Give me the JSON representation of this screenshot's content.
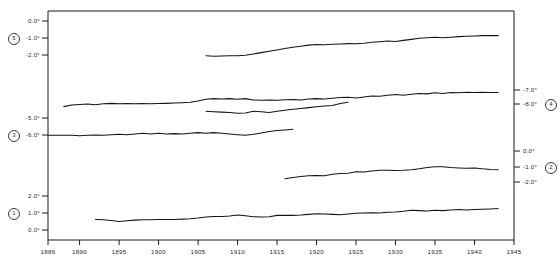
{
  "chart_data": {
    "type": "line",
    "title": "",
    "subtitle": "",
    "xlabel": "",
    "ylabel": "",
    "grid": false,
    "legend_position": "inline-axis-markers",
    "xlim": [
      1886,
      1945
    ],
    "x_ticks": [
      {
        "value": 1886,
        "label": "1886"
      },
      {
        "value": 1890,
        "label": "1890"
      },
      {
        "value": 1895,
        "label": "1895"
      },
      {
        "value": 1900,
        "label": "1900"
      },
      {
        "value": 1905,
        "label": "1905"
      },
      {
        "value": 1910,
        "label": "1910"
      },
      {
        "value": 1915,
        "label": "1915"
      },
      {
        "value": 1920,
        "label": "1920"
      },
      {
        "value": 1925,
        "label": "1925"
      },
      {
        "value": 1930,
        "label": "1930"
      },
      {
        "value": 1935,
        "label": "1935"
      },
      {
        "value": 1940,
        "label": "1940"
      },
      {
        "value": 1945,
        "label": "1945"
      }
    ],
    "left_axis_ticks": [
      {
        "label": "0.0°",
        "y": 21
      },
      {
        "label": "-1.0°",
        "y": 38,
        "series_marker": "5"
      },
      {
        "label": "-2.0°",
        "y": 55
      },
      {
        "label": "-5.0°",
        "y": 118
      },
      {
        "label": "-6.0°",
        "y": 135,
        "series_marker": "3"
      },
      {
        "label": "2.0°",
        "y": 196
      },
      {
        "label": "1.0°",
        "y": 213,
        "series_marker": "1"
      },
      {
        "label": "0.0°",
        "y": 230
      }
    ],
    "right_axis_ticks": [
      {
        "label": "-7.0°",
        "y": 90
      },
      {
        "label": "-8.0°",
        "y": 104,
        "series_marker": "4"
      },
      {
        "label": "0.0°",
        "y": 151
      },
      {
        "label": "-1.0°",
        "y": 167,
        "series_marker": "2"
      },
      {
        "label": "-2.0°",
        "y": 182
      }
    ],
    "series": [
      {
        "name": "5",
        "marker": "5",
        "axis": "left",
        "x_start": 1906,
        "x_end": 1943,
        "points": [
          [
            1906,
            -2.05
          ],
          [
            1907,
            -2.07
          ],
          [
            1908,
            -2.06
          ],
          [
            1909,
            -2.04
          ],
          [
            1910,
            -2.05
          ],
          [
            1911,
            -2.02
          ],
          [
            1912,
            -1.94
          ],
          [
            1913,
            -1.86
          ],
          [
            1914,
            -1.78
          ],
          [
            1915,
            -1.7
          ],
          [
            1916,
            -1.62
          ],
          [
            1917,
            -1.55
          ],
          [
            1918,
            -1.48
          ],
          [
            1919,
            -1.42
          ],
          [
            1920,
            -1.38
          ],
          [
            1921,
            -1.4
          ],
          [
            1922,
            -1.37
          ],
          [
            1923,
            -1.35
          ],
          [
            1924,
            -1.33
          ],
          [
            1925,
            -1.34
          ],
          [
            1926,
            -1.31
          ],
          [
            1927,
            -1.25
          ],
          [
            1928,
            -1.22
          ],
          [
            1929,
            -1.18
          ],
          [
            1930,
            -1.2
          ],
          [
            1931,
            -1.14
          ],
          [
            1932,
            -1.08
          ],
          [
            1933,
            -1.02
          ],
          [
            1934,
            -0.98
          ],
          [
            1935,
            -0.95
          ],
          [
            1936,
            -0.99
          ],
          [
            1937,
            -0.95
          ],
          [
            1938,
            -0.92
          ],
          [
            1939,
            -0.9
          ],
          [
            1940,
            -0.88
          ],
          [
            1941,
            -0.86
          ],
          [
            1942,
            -0.86
          ],
          [
            1943,
            -0.86
          ]
        ]
      },
      {
        "name": "4",
        "marker": "4",
        "axis": "right",
        "x_start": 1906,
        "x_end": 1924,
        "points": [
          [
            1906,
            -8.52
          ],
          [
            1907,
            -8.55
          ],
          [
            1908,
            -8.58
          ],
          [
            1909,
            -8.6
          ],
          [
            1910,
            -8.66
          ],
          [
            1911,
            -8.64
          ],
          [
            1912,
            -8.52
          ],
          [
            1913,
            -8.56
          ],
          [
            1914,
            -8.6
          ],
          [
            1915,
            -8.52
          ],
          [
            1916,
            -8.44
          ],
          [
            1917,
            -8.38
          ],
          [
            1918,
            -8.32
          ],
          [
            1919,
            -8.26
          ],
          [
            1920,
            -8.2
          ],
          [
            1921,
            -8.14
          ],
          [
            1922,
            -8.1
          ],
          [
            1923,
            -7.96
          ],
          [
            1924,
            -7.88
          ]
        ]
      },
      {
        "name": "3",
        "marker": "3",
        "axis": "left",
        "x_start": 1888,
        "x_end": 1943,
        "points": [
          [
            1888,
            -4.33
          ],
          [
            1889,
            -4.24
          ],
          [
            1890,
            -4.2
          ],
          [
            1891,
            -4.18
          ],
          [
            1892,
            -4.22
          ],
          [
            1893,
            -4.16
          ],
          [
            1894,
            -4.14
          ],
          [
            1895,
            -4.16
          ],
          [
            1896,
            -4.15
          ],
          [
            1897,
            -4.16
          ],
          [
            1898,
            -4.15
          ],
          [
            1899,
            -4.16
          ],
          [
            1900,
            -4.15
          ],
          [
            1901,
            -4.14
          ],
          [
            1902,
            -4.12
          ],
          [
            1903,
            -4.1
          ],
          [
            1904,
            -4.07
          ],
          [
            1905,
            -4.0
          ],
          [
            1906,
            -3.9
          ],
          [
            1907,
            -3.86
          ],
          [
            1908,
            -3.88
          ],
          [
            1909,
            -3.86
          ],
          [
            1910,
            -3.9
          ],
          [
            1911,
            -3.86
          ],
          [
            1912,
            -3.94
          ],
          [
            1913,
            -3.96
          ],
          [
            1914,
            -3.94
          ],
          [
            1915,
            -3.96
          ],
          [
            1916,
            -3.93
          ],
          [
            1917,
            -3.92
          ],
          [
            1918,
            -3.94
          ],
          [
            1919,
            -3.88
          ],
          [
            1920,
            -3.86
          ],
          [
            1921,
            -3.88
          ],
          [
            1922,
            -3.84
          ],
          [
            1923,
            -3.8
          ],
          [
            1924,
            -3.78
          ],
          [
            1925,
            -3.82
          ],
          [
            1926,
            -3.76
          ],
          [
            1927,
            -3.7
          ],
          [
            1928,
            -3.72
          ],
          [
            1929,
            -3.66
          ],
          [
            1930,
            -3.62
          ],
          [
            1931,
            -3.66
          ],
          [
            1932,
            -3.6
          ],
          [
            1933,
            -3.56
          ],
          [
            1934,
            -3.58
          ],
          [
            1935,
            -3.52
          ],
          [
            1936,
            -3.56
          ],
          [
            1937,
            -3.5
          ],
          [
            1938,
            -3.52
          ],
          [
            1939,
            -3.48
          ],
          [
            1940,
            -3.5
          ],
          [
            1941,
            -3.48
          ],
          [
            1942,
            -3.5
          ],
          [
            1943,
            -3.5
          ]
        ]
      },
      {
        "name": "6-series-unlabeled",
        "marker": "",
        "axis": "left",
        "x_start": 1886,
        "x_end": 1917,
        "points": [
          [
            1886,
            -6.02
          ],
          [
            1887,
            -6.02
          ],
          [
            1888,
            -6.02
          ],
          [
            1889,
            -6.02
          ],
          [
            1890,
            -6.04
          ],
          [
            1891,
            -6.02
          ],
          [
            1892,
            -6.0
          ],
          [
            1893,
            -6.02
          ],
          [
            1894,
            -5.98
          ],
          [
            1895,
            -5.96
          ],
          [
            1896,
            -5.98
          ],
          [
            1897,
            -5.94
          ],
          [
            1898,
            -5.9
          ],
          [
            1899,
            -5.94
          ],
          [
            1900,
            -5.9
          ],
          [
            1901,
            -5.94
          ],
          [
            1902,
            -5.92
          ],
          [
            1903,
            -5.94
          ],
          [
            1904,
            -5.9
          ],
          [
            1905,
            -5.86
          ],
          [
            1906,
            -5.9
          ],
          [
            1907,
            -5.86
          ],
          [
            1908,
            -5.9
          ],
          [
            1909,
            -5.94
          ],
          [
            1910,
            -5.98
          ],
          [
            1911,
            -6.02
          ],
          [
            1912,
            -5.96
          ],
          [
            1913,
            -5.88
          ],
          [
            1914,
            -5.8
          ],
          [
            1915,
            -5.74
          ],
          [
            1916,
            -5.7
          ],
          [
            1917,
            -5.66
          ]
        ]
      },
      {
        "name": "2",
        "marker": "2",
        "axis": "right",
        "x_start": 1916,
        "x_end": 1943,
        "points": [
          [
            1916,
            -1.78
          ],
          [
            1917,
            -1.7
          ],
          [
            1918,
            -1.64
          ],
          [
            1919,
            -1.58
          ],
          [
            1920,
            -1.56
          ],
          [
            1921,
            -1.58
          ],
          [
            1922,
            -1.48
          ],
          [
            1923,
            -1.44
          ],
          [
            1924,
            -1.42
          ],
          [
            1925,
            -1.32
          ],
          [
            1926,
            -1.34
          ],
          [
            1927,
            -1.26
          ],
          [
            1928,
            -1.22
          ],
          [
            1929,
            -1.22
          ],
          [
            1930,
            -1.24
          ],
          [
            1931,
            -1.22
          ],
          [
            1932,
            -1.18
          ],
          [
            1933,
            -1.12
          ],
          [
            1934,
            -1.04
          ],
          [
            1935,
            -0.98
          ],
          [
            1936,
            -0.98
          ],
          [
            1937,
            -1.04
          ],
          [
            1938,
            -1.06
          ],
          [
            1939,
            -1.08
          ],
          [
            1940,
            -1.06
          ],
          [
            1941,
            -1.12
          ],
          [
            1942,
            -1.16
          ],
          [
            1943,
            -1.18
          ]
        ]
      },
      {
        "name": "1",
        "marker": "1",
        "axis": "left",
        "x_start": 1892,
        "x_end": 1943,
        "points": [
          [
            1892,
            0.62
          ],
          [
            1893,
            0.6
          ],
          [
            1894,
            0.56
          ],
          [
            1895,
            0.5
          ],
          [
            1896,
            0.54
          ],
          [
            1897,
            0.58
          ],
          [
            1898,
            0.6
          ],
          [
            1899,
            0.6
          ],
          [
            1900,
            0.62
          ],
          [
            1901,
            0.62
          ],
          [
            1902,
            0.62
          ],
          [
            1903,
            0.64
          ],
          [
            1904,
            0.66
          ],
          [
            1905,
            0.7
          ],
          [
            1906,
            0.76
          ],
          [
            1907,
            0.8
          ],
          [
            1908,
            0.8
          ],
          [
            1909,
            0.82
          ],
          [
            1910,
            0.88
          ],
          [
            1911,
            0.84
          ],
          [
            1912,
            0.78
          ],
          [
            1913,
            0.76
          ],
          [
            1914,
            0.78
          ],
          [
            1915,
            0.86
          ],
          [
            1916,
            0.86
          ],
          [
            1917,
            0.86
          ],
          [
            1918,
            0.88
          ],
          [
            1919,
            0.92
          ],
          [
            1920,
            0.96
          ],
          [
            1921,
            0.94
          ],
          [
            1922,
            0.92
          ],
          [
            1923,
            0.9
          ],
          [
            1924,
            0.94
          ],
          [
            1925,
            0.98
          ],
          [
            1926,
            1.0
          ],
          [
            1927,
            1.02
          ],
          [
            1928,
            1.0
          ],
          [
            1929,
            1.04
          ],
          [
            1930,
            1.06
          ],
          [
            1931,
            1.1
          ],
          [
            1932,
            1.16
          ],
          [
            1933,
            1.14
          ],
          [
            1934,
            1.12
          ],
          [
            1935,
            1.16
          ],
          [
            1936,
            1.14
          ],
          [
            1937,
            1.18
          ],
          [
            1938,
            1.2
          ],
          [
            1939,
            1.18
          ],
          [
            1940,
            1.2
          ],
          [
            1941,
            1.22
          ],
          [
            1942,
            1.24
          ],
          [
            1943,
            1.26
          ]
        ]
      }
    ]
  },
  "axes": {
    "frame_color": "#1a1a1a",
    "line_color": "#1a1a1a"
  }
}
